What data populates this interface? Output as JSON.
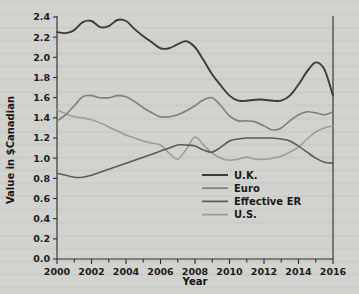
{
  "figure": {
    "background_color": "#d2d2ce",
    "plot_background_color": "#d2d2ce"
  },
  "chart_data": {
    "type": "line",
    "title": "",
    "xlabel": "Year",
    "ylabel": "Value in $Canadian",
    "xlim": [
      2000,
      2016
    ],
    "ylim": [
      0.0,
      2.4
    ],
    "grid": false,
    "legend_position": "center-right-inside",
    "x_tick_labels": [
      "2000",
      "2002",
      "2004",
      "2006",
      "2008",
      "2010",
      "2012",
      "2014",
      "2016"
    ],
    "x_tick_values": [
      2000,
      2002,
      2004,
      2006,
      2008,
      2010,
      2012,
      2014,
      2016
    ],
    "x_minor_tick_values": [
      2001,
      2003,
      2005,
      2007,
      2009,
      2011,
      2013,
      2015
    ],
    "y_tick_labels": [
      "0.0",
      "0.2",
      "0.4",
      "0.6",
      "0.8",
      "1.0",
      "1.2",
      "1.4",
      "1.6",
      "1.8",
      "2.0",
      "2.2",
      "2.4"
    ],
    "y_tick_values": [
      0.0,
      0.2,
      0.4,
      0.6,
      0.8,
      1.0,
      1.2,
      1.4,
      1.6,
      1.8,
      2.0,
      2.2,
      2.4
    ],
    "x": [
      2000,
      2000.5,
      2001,
      2001.5,
      2002,
      2002.5,
      2003,
      2003.5,
      2004,
      2004.5,
      2005,
      2005.5,
      2006,
      2006.5,
      2007,
      2007.5,
      2008,
      2008.5,
      2009,
      2009.5,
      2010,
      2010.5,
      2011,
      2011.5,
      2012,
      2012.5,
      2013,
      2013.5,
      2014,
      2014.5,
      2015,
      2015.5,
      2016
    ],
    "series": [
      {
        "name": "U.K.",
        "color": "#3b3b3b",
        "values": [
          2.25,
          2.24,
          2.27,
          2.35,
          2.36,
          2.3,
          2.31,
          2.37,
          2.36,
          2.28,
          2.21,
          2.15,
          2.09,
          2.09,
          2.13,
          2.16,
          2.1,
          1.97,
          1.83,
          1.72,
          1.62,
          1.57,
          1.57,
          1.58,
          1.58,
          1.57,
          1.57,
          1.62,
          1.73,
          1.86,
          1.95,
          1.88,
          1.62
        ]
      },
      {
        "name": "Euro",
        "color": "#7d7d7a",
        "values": [
          1.37,
          1.43,
          1.52,
          1.61,
          1.62,
          1.6,
          1.6,
          1.62,
          1.61,
          1.56,
          1.5,
          1.45,
          1.41,
          1.41,
          1.43,
          1.47,
          1.52,
          1.58,
          1.6,
          1.52,
          1.42,
          1.37,
          1.37,
          1.36,
          1.32,
          1.28,
          1.3,
          1.37,
          1.43,
          1.46,
          1.45,
          1.43,
          1.46
        ]
      },
      {
        "name": "Effective ER",
        "color": "#5a5a58",
        "values": [
          0.85,
          0.83,
          0.81,
          0.81,
          0.83,
          0.86,
          0.89,
          0.92,
          0.95,
          0.98,
          1.01,
          1.04,
          1.07,
          1.1,
          1.13,
          1.13,
          1.12,
          1.08,
          1.06,
          1.11,
          1.17,
          1.19,
          1.2,
          1.2,
          1.2,
          1.2,
          1.19,
          1.17,
          1.12,
          1.06,
          1.0,
          0.96,
          0.95
        ]
      },
      {
        "name": "U.S.",
        "color": "#9b9b98",
        "values": [
          1.48,
          1.44,
          1.41,
          1.4,
          1.38,
          1.35,
          1.31,
          1.27,
          1.23,
          1.2,
          1.17,
          1.15,
          1.13,
          1.05,
          0.99,
          1.09,
          1.21,
          1.13,
          1.05,
          1.0,
          0.98,
          0.99,
          1.01,
          0.99,
          0.99,
          1.0,
          1.02,
          1.06,
          1.11,
          1.19,
          1.26,
          1.3,
          1.32
        ]
      }
    ]
  },
  "legend": {
    "entries": [
      {
        "label": "U.K.",
        "color": "#3b3b3b"
      },
      {
        "label": "Euro",
        "color": "#7d7d7a"
      },
      {
        "label": "Effective ER",
        "color": "#5a5a58"
      },
      {
        "label": "U.S.",
        "color": "#9b9b98"
      }
    ]
  }
}
